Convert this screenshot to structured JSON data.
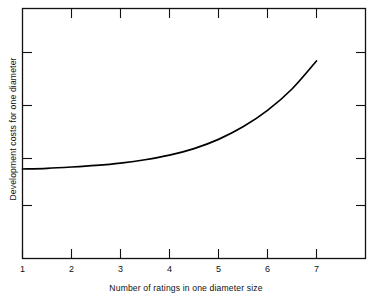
{
  "chart_data": {
    "type": "line",
    "title": "",
    "xlabel": "Number of ratings in one diameter size",
    "ylabel": "Development costs for one diameter",
    "xticklabels": [
      "1",
      "2",
      "3",
      "4",
      "5",
      "6",
      "7"
    ],
    "x": [
      1,
      2,
      3,
      4,
      5,
      6,
      7
    ],
    "yticklabels": [
      "",
      "",
      "",
      ""
    ],
    "xlim": [
      1,
      8
    ],
    "ylim": [
      0,
      5
    ],
    "grid": false,
    "legend": null,
    "series": [
      {
        "name": "Development cost curve",
        "x": [
          1,
          1.5,
          2,
          2.5,
          3,
          3.5,
          4,
          4.5,
          5,
          5.5,
          6,
          6.5,
          7
        ],
        "values": [
          1.72,
          1.74,
          1.78,
          1.83,
          1.9,
          2.0,
          2.14,
          2.34,
          2.62,
          3.0,
          3.5,
          4.15,
          5.0
        ],
        "color": "#000000",
        "linewidth": 1.6,
        "description": "Monotonically increasing convex curve, nearly flat from 1 to 4 then rising steeply to 7"
      }
    ]
  },
  "figure": {
    "background_color": "#ffffff",
    "axes_color": "#000000",
    "curve_color": "#000000",
    "xlabel": "Number of ratings in one diameter size",
    "ylabel": "Development costs for one diameter",
    "xticks": [
      "1",
      "2",
      "3",
      "4",
      "5",
      "6",
      "7"
    ]
  }
}
